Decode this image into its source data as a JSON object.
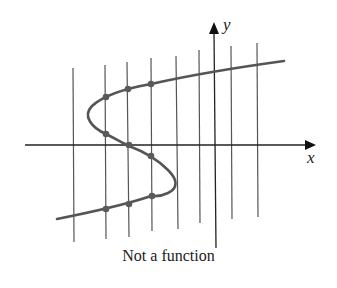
{
  "figure": {
    "caption": "Not a function",
    "x_axis_label": "x",
    "y_axis_label": "y",
    "colors": {
      "axis": "#222222",
      "curve": "#555555",
      "vertical_lines": "#555555",
      "points": "#555555"
    }
  },
  "diagram": {
    "type": "vertical-line-test",
    "vertical_line_count": 8,
    "intersection_points_marked": 9
  }
}
